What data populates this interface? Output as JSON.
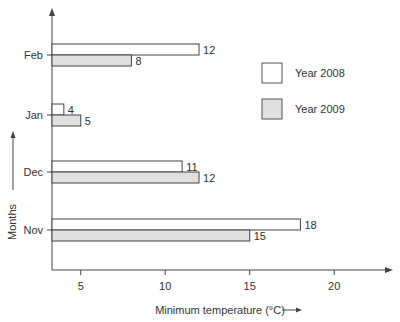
{
  "chart_data": {
    "type": "bar",
    "orientation": "horizontal",
    "title": "",
    "xlabel": "Minimum temperature (°C)",
    "ylabel": "Months",
    "categories": [
      "Nov",
      "Dec",
      "Jan",
      "Feb"
    ],
    "series": [
      {
        "name": "Year 2008",
        "values": [
          18,
          11,
          4,
          12
        ],
        "color": "#ffffff"
      },
      {
        "name": "Year 2009",
        "values": [
          15,
          12,
          5,
          8
        ],
        "color": "#e0e0e0"
      }
    ],
    "xticks": [
      5,
      10,
      15,
      20
    ],
    "xlim": [
      3.3,
      24
    ],
    "grid": false,
    "legend_position": "right"
  },
  "legend": {
    "items": [
      "Year 2008",
      "Year 2009"
    ]
  }
}
